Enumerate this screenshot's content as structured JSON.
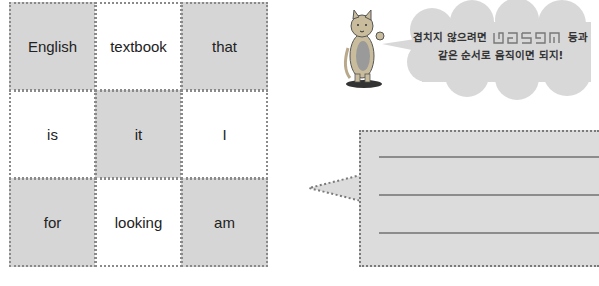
{
  "word_grid": {
    "rows": [
      [
        {
          "word": "English",
          "shaded": true
        },
        {
          "word": "textbook",
          "shaded": false
        },
        {
          "word": "that",
          "shaded": true
        }
      ],
      [
        {
          "word": "is",
          "shaded": false
        },
        {
          "word": "it",
          "shaded": true
        },
        {
          "word": "I",
          "shaded": false
        }
      ],
      [
        {
          "word": "for",
          "shaded": true
        },
        {
          "word": "looking",
          "shaded": false
        },
        {
          "word": "am",
          "shaded": true
        }
      ]
    ]
  },
  "speech_bubble": {
    "line1_before": "겹치지 않으려면",
    "line1_after": "등과",
    "line2": "같은 순서로 움직이면 되지!",
    "maze_icons": [
      "path-pattern-1",
      "path-pattern-2",
      "path-pattern-3",
      "path-pattern-4",
      "path-pattern-5"
    ]
  },
  "answer_box": {
    "lines": 3
  },
  "colors": {
    "shaded_cell": "#d6d6d6",
    "dotted_border": "#8a8a8a",
    "answer_fill": "#dcdcdc",
    "cloud_fill": "#d8d8d8"
  }
}
